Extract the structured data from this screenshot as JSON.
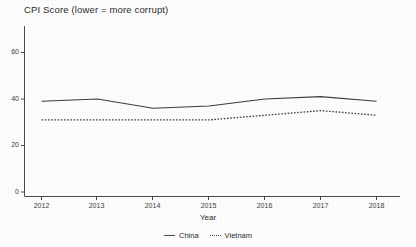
{
  "chart_data": {
    "type": "line",
    "title": "CPI Score (lower = more corrupt)",
    "xlabel": "Year",
    "ylabel": "",
    "x": [
      2012,
      2013,
      2014,
      2015,
      2016,
      2017,
      2018
    ],
    "xticklabels": [
      "2012",
      "2013",
      "2014",
      "2015",
      "2016",
      "2017",
      "2018"
    ],
    "yticks": [
      0,
      20,
      40,
      60
    ],
    "yticklabels": [
      "0",
      "20",
      "40",
      "60"
    ],
    "xlim": [
      2012,
      2018
    ],
    "ylim": [
      0,
      65
    ],
    "grid": false,
    "legend_position": "bottom-center",
    "series": [
      {
        "name": "China",
        "style": "solid",
        "color": "#3c3c3c",
        "values": [
          39,
          40,
          36,
          37,
          40,
          41,
          39
        ]
      },
      {
        "name": "Vietnam",
        "style": "dotted",
        "color": "#3c3c3c",
        "values": [
          31,
          31,
          31,
          31,
          33,
          35,
          33
        ]
      }
    ]
  },
  "axes": {
    "y_tick_0": "0",
    "y_tick_20": "20",
    "y_tick_40": "40",
    "y_tick_60": "60",
    "x_tick_2012": "2012",
    "x_tick_2013": "2013",
    "x_tick_2014": "2014",
    "x_tick_2015": "2015",
    "x_tick_2016": "2016",
    "x_tick_2017": "2017",
    "x_tick_2018": "2018",
    "x_axis_title": "Year"
  },
  "legend": {
    "china_label": "China",
    "vietnam_label": "Vietnam"
  }
}
